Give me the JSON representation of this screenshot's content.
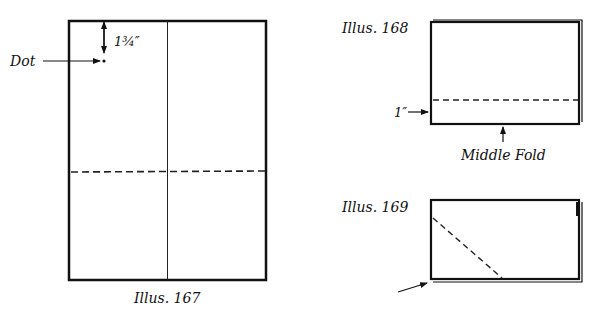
{
  "figures": [
    {
      "id": "illus-167",
      "caption": "Illus. 167",
      "labels": {
        "dot": "Dot",
        "measure": "1¾″"
      }
    },
    {
      "id": "illus-168",
      "caption": "Illus. 168",
      "labels": {
        "measure": "1″",
        "fold": "Middle Fold"
      }
    },
    {
      "id": "illus-169",
      "caption": "Illus. 169"
    }
  ],
  "colors": {
    "ink": "#111111",
    "paper": "#ffffff"
  }
}
